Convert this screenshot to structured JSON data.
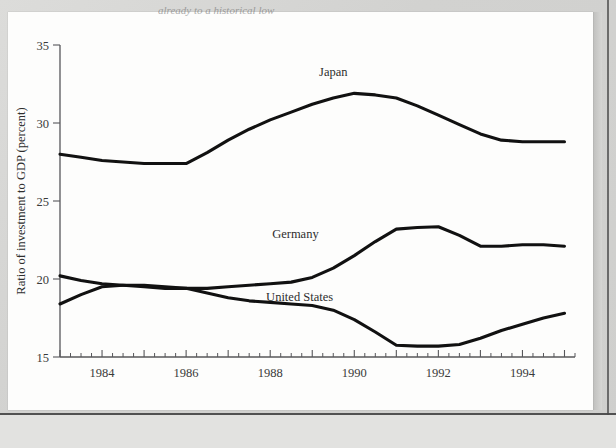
{
  "page": {
    "truncated_header_text": "already to a historical low",
    "background_color": "#d6d6d4",
    "paper_color": "#fdfdfc"
  },
  "chart_data": {
    "type": "line",
    "title": "",
    "subtitle": "",
    "xlabel": "",
    "ylabel": "Ratio of investment to GDP (percent)",
    "ylim": [
      15,
      35
    ],
    "xlim": [
      1983.0,
      1995.25
    ],
    "ytick_labels": [
      "15",
      "20",
      "25",
      "30",
      "35"
    ],
    "ytick_values": [
      15,
      20,
      25,
      30,
      35
    ],
    "xtick_labels": [
      "1984",
      "1986",
      "1988",
      "1990",
      "1992",
      "1994"
    ],
    "xtick_values": [
      1984,
      1986,
      1988,
      1990,
      1992,
      1994
    ],
    "x_minor_tick_interval": 0.25,
    "grid": false,
    "legend_position": "inline-labels",
    "line_color": "#111111",
    "axis_color": "#57575a",
    "x": [
      1983.0,
      1983.5,
      1984.0,
      1984.5,
      1985.0,
      1985.5,
      1986.0,
      1986.5,
      1987.0,
      1987.5,
      1988.0,
      1988.5,
      1989.0,
      1989.5,
      1990.0,
      1990.5,
      1991.0,
      1991.5,
      1992.0,
      1992.5,
      1993.0,
      1993.5,
      1994.0,
      1994.5,
      1995.0
    ],
    "series": [
      {
        "name": "Japan",
        "label": "Japan",
        "label_x": 1989.5,
        "label_y": 33.0,
        "values": [
          28.0,
          27.8,
          27.6,
          27.5,
          27.4,
          27.4,
          27.4,
          28.1,
          28.9,
          29.6,
          30.2,
          30.7,
          31.2,
          31.6,
          31.9,
          31.8,
          31.6,
          31.1,
          30.5,
          29.9,
          29.3,
          28.9,
          28.8,
          28.8,
          28.8
        ]
      },
      {
        "name": "Germany",
        "label": "Germany",
        "label_x": 1988.6,
        "label_y": 22.6,
        "values": [
          20.2,
          19.9,
          19.7,
          19.6,
          19.5,
          19.4,
          19.4,
          19.4,
          19.5,
          19.6,
          19.7,
          19.8,
          20.1,
          20.7,
          21.5,
          22.4,
          23.2,
          23.3,
          23.35,
          22.8,
          22.1,
          22.1,
          22.2,
          22.2,
          22.1
        ]
      },
      {
        "name": "United States",
        "label": "United States",
        "label_x": 1988.7,
        "label_y": 18.6,
        "values": [
          18.4,
          19.0,
          19.5,
          19.6,
          19.6,
          19.5,
          19.4,
          19.1,
          18.8,
          18.6,
          18.5,
          18.4,
          18.3,
          18.0,
          17.4,
          16.6,
          15.75,
          15.7,
          15.7,
          15.8,
          16.2,
          16.7,
          17.1,
          17.5,
          17.8
        ]
      }
    ]
  }
}
